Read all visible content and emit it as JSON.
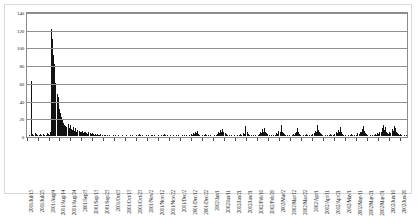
{
  "chart_data": {
    "type": "bar",
    "title": "",
    "subtitle": "",
    "xlabel": "",
    "ylabel": "",
    "ylim": [
      0,
      140
    ],
    "ytick_step": 20,
    "yticks": [
      0,
      20,
      40,
      60,
      80,
      100,
      120,
      140
    ],
    "ytick_labels": [
      "0",
      "20",
      "40",
      "60",
      "80",
      "100",
      "120",
      "140"
    ],
    "grid": true,
    "legend": "none",
    "bar_color": "#121212",
    "gridline_color": "#8f8f8f",
    "axis_color": "#8a8a8a",
    "xtick_interval_days": 10,
    "xtick_labels": [
      "2001/Jul/15",
      "2001/Jul/25",
      "2001/Aug/4",
      "2001/Aug/14",
      "2001/Aug/24",
      "2001/Sep/3",
      "2001/Sep/13",
      "2001/Sep/23",
      "2001/Oct/3",
      "2001/Oct/13",
      "2001/Oct/23",
      "2001/Nov/2",
      "2001/Nov/12",
      "2001/Nov/22",
      "2001/Dec/2",
      "2001/Dec/12",
      "2001/Dec/22",
      "2002/Jan/1",
      "2002/Jan/11",
      "2002/Jan/21",
      "2002/Jan/31",
      "2002/Feb/10",
      "2002/Feb/20",
      "2002/Mar/2",
      "2002/Mar/12",
      "2002/Mar/22",
      "2002/Apr/1",
      "2002/Apr/11",
      "2002/Apr/21",
      "2002/May/1",
      "2002/May/11",
      "2002/May/21",
      "2002/May/31",
      "2002/Jun/10",
      "2002/Jun/20"
    ],
    "x_start": "2001/Jul/15",
    "x_end": "2002/Jun/25",
    "n_points": 346,
    "peak_value": 121,
    "peak_label": "2001/Jul/19",
    "values": [
      0,
      1,
      0,
      62,
      2,
      1,
      3,
      2,
      1,
      0,
      1,
      2,
      1,
      0,
      2,
      1,
      1,
      3,
      2,
      1,
      4,
      121,
      110,
      92,
      81,
      60,
      47,
      44,
      30,
      26,
      22,
      18,
      15,
      13,
      11,
      10,
      14,
      9,
      12,
      8,
      7,
      10,
      6,
      9,
      5,
      7,
      6,
      5,
      4,
      6,
      3,
      5,
      4,
      3,
      2,
      4,
      3,
      2,
      3,
      2,
      1,
      2,
      1,
      2,
      1,
      1,
      2,
      1,
      0,
      1,
      1,
      0,
      1,
      0,
      1,
      0,
      0,
      1,
      0,
      1,
      0,
      0,
      1,
      0,
      0,
      0,
      1,
      0,
      0,
      1,
      0,
      0,
      0,
      1,
      0,
      1,
      0,
      0,
      1,
      0,
      1,
      2,
      1,
      0,
      1,
      0,
      0,
      1,
      0,
      1,
      0,
      0,
      1,
      1,
      0,
      1,
      0,
      0,
      1,
      0,
      0,
      1,
      0,
      1,
      2,
      1,
      0,
      1,
      0,
      1,
      0,
      0,
      1,
      0,
      0,
      1,
      0,
      1,
      0,
      0,
      1,
      0,
      1,
      0,
      1,
      0,
      0,
      1,
      2,
      1,
      3,
      2,
      5,
      3,
      6,
      2,
      1,
      0,
      1,
      0,
      1,
      2,
      1,
      0,
      1,
      0,
      1,
      0,
      0,
      1,
      0,
      1,
      2,
      4,
      3,
      7,
      5,
      8,
      4,
      3,
      2,
      1,
      0,
      1,
      0,
      1,
      0,
      0,
      1,
      0,
      1,
      0,
      1,
      2,
      1,
      0,
      3,
      2,
      11,
      4,
      2,
      1,
      0,
      1,
      0,
      1,
      0,
      1,
      0,
      1,
      2,
      4,
      3,
      8,
      5,
      9,
      4,
      3,
      2,
      1,
      0,
      1,
      0,
      1,
      0,
      1,
      3,
      2,
      6,
      4,
      12,
      5,
      3,
      2,
      1,
      0,
      1,
      0,
      1,
      0,
      1,
      2,
      1,
      3,
      5,
      9,
      4,
      2,
      1,
      0,
      1,
      0,
      1,
      2,
      1,
      0,
      1,
      0,
      1,
      2,
      3,
      6,
      5,
      13,
      7,
      4,
      3,
      2,
      1,
      0,
      1,
      0,
      1,
      0,
      1,
      2,
      1,
      0,
      1,
      2,
      4,
      3,
      7,
      5,
      10,
      4,
      2,
      1,
      0,
      1,
      0,
      1,
      0,
      1,
      2,
      1,
      0,
      1,
      0,
      1,
      3,
      2,
      5,
      4,
      8,
      11,
      6,
      3,
      2,
      1,
      0,
      1,
      0,
      1,
      0,
      1,
      2,
      1,
      3,
      2,
      5,
      4,
      9,
      12,
      7,
      10,
      5,
      3,
      2,
      4,
      3,
      8,
      6,
      11,
      9,
      5,
      3,
      2,
      1,
      2,
      1,
      0,
      1,
      0,
      1,
      0
    ]
  }
}
